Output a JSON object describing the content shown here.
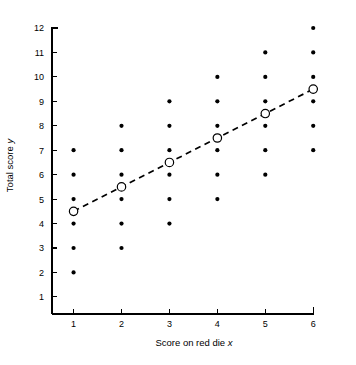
{
  "chart_data": {
    "type": "scatter",
    "title": "",
    "xlabel": "Score on red die x",
    "xlabel_plain": "Score on red die",
    "xlabel_italic": "x",
    "ylabel": "Total score y",
    "ylabel_plain": "Total score",
    "ylabel_italic": "y",
    "xlim": [
      0.55,
      6.35
    ],
    "ylim": [
      0.3,
      12.45
    ],
    "xticks": [
      1,
      2,
      3,
      4,
      5,
      6
    ],
    "yticks": [
      1,
      2,
      3,
      4,
      5,
      6,
      7,
      8,
      9,
      10,
      11,
      12
    ],
    "xtick_labels": [
      "1",
      "2",
      "3",
      "4",
      "5",
      "6"
    ],
    "ytick_labels": [
      "1",
      "2",
      "3",
      "4",
      "5",
      "6",
      "7",
      "8",
      "9",
      "10",
      "11",
      "12"
    ],
    "grid": false,
    "legend": false,
    "series": [
      {
        "name": "Sample points",
        "marker": "filled-dot",
        "color": "#000000",
        "points": [
          {
            "x": 1,
            "y": 2
          },
          {
            "x": 1,
            "y": 3
          },
          {
            "x": 1,
            "y": 4
          },
          {
            "x": 1,
            "y": 5
          },
          {
            "x": 1,
            "y": 6
          },
          {
            "x": 1,
            "y": 7
          },
          {
            "x": 2,
            "y": 3
          },
          {
            "x": 2,
            "y": 4
          },
          {
            "x": 2,
            "y": 5
          },
          {
            "x": 2,
            "y": 6
          },
          {
            "x": 2,
            "y": 7
          },
          {
            "x": 2,
            "y": 8
          },
          {
            "x": 3,
            "y": 4
          },
          {
            "x": 3,
            "y": 5
          },
          {
            "x": 3,
            "y": 6
          },
          {
            "x": 3,
            "y": 7
          },
          {
            "x": 3,
            "y": 8
          },
          {
            "x": 3,
            "y": 9
          },
          {
            "x": 4,
            "y": 5
          },
          {
            "x": 4,
            "y": 6
          },
          {
            "x": 4,
            "y": 7
          },
          {
            "x": 4,
            "y": 8
          },
          {
            "x": 4,
            "y": 9
          },
          {
            "x": 4,
            "y": 10
          },
          {
            "x": 5,
            "y": 6
          },
          {
            "x": 5,
            "y": 7
          },
          {
            "x": 5,
            "y": 8
          },
          {
            "x": 5,
            "y": 9
          },
          {
            "x": 5,
            "y": 10
          },
          {
            "x": 5,
            "y": 11
          },
          {
            "x": 6,
            "y": 7
          },
          {
            "x": 6,
            "y": 8
          },
          {
            "x": 6,
            "y": 9
          },
          {
            "x": 6,
            "y": 10
          },
          {
            "x": 6,
            "y": 11
          },
          {
            "x": 6,
            "y": 12
          }
        ]
      },
      {
        "name": "Conditional mean",
        "marker": "open-circle",
        "line": "dashed",
        "color": "#000000",
        "points": [
          {
            "x": 1,
            "y": 4.5
          },
          {
            "x": 2,
            "y": 5.5
          },
          {
            "x": 3,
            "y": 6.5
          },
          {
            "x": 4,
            "y": 7.5
          },
          {
            "x": 5,
            "y": 8.5
          },
          {
            "x": 6,
            "y": 9.5
          }
        ]
      }
    ]
  }
}
